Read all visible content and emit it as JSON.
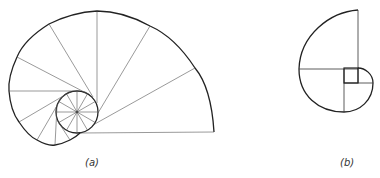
{
  "figure_a": {
    "label": "(a)",
    "description": "Involute of a circle with tangent construction lines",
    "circle": {
      "cx": 77,
      "cy": 112,
      "r": 21,
      "spokes": 12
    }
  },
  "figure_b": {
    "label": "(b)",
    "description": "Involute of a square with construction lines"
  },
  "colors": {
    "stroke": "#222222",
    "thin": "#555555",
    "background": "#ffffff"
  }
}
